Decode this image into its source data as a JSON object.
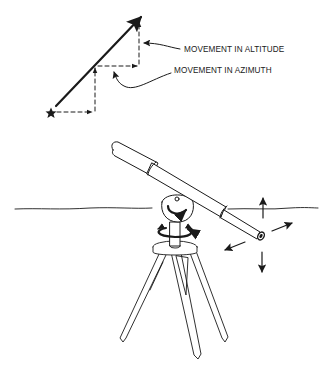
{
  "diagram": {
    "labels": {
      "altitude": "MOVEMENT IN ALTITUDE",
      "azimuth": "MOVEMENT IN AZIMUTH"
    },
    "icons": {
      "star": "star-icon",
      "telescope": "telescope-illustration",
      "tripod": "tripod-illustration"
    },
    "colors": {
      "ink": "#1a1a1a",
      "background": "#ffffff"
    }
  }
}
